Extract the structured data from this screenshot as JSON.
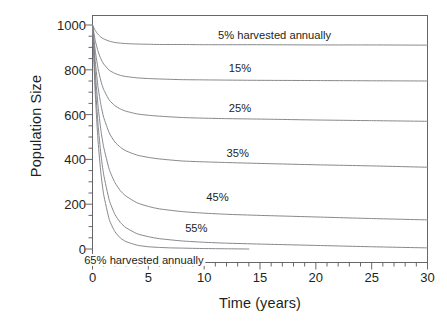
{
  "chart_data": {
    "type": "line",
    "title": "",
    "xlabel": "Time (years)",
    "ylabel": "Population Size",
    "xlim": [
      0,
      30
    ],
    "ylim": [
      0,
      1000
    ],
    "xticks": [
      0,
      5,
      10,
      15,
      20,
      25,
      30
    ],
    "yticks": [
      0,
      200,
      400,
      600,
      800,
      1000
    ],
    "xtick_labels": [
      "0",
      "5",
      "10",
      "15",
      "20",
      "25",
      "30"
    ],
    "ytick_labels": [
      "0",
      "200",
      "400",
      "600",
      "800",
      "1000"
    ],
    "xminor_step": 1,
    "yminor_step": 50,
    "grid": false,
    "legend": "inline-labels",
    "line_color": "#808286",
    "axis_color": "#58585b",
    "text_color": "#231f20",
    "background": "#ffffff",
    "initial_population": 1000,
    "series": [
      {
        "name": "5% harvested annually",
        "label": "5% harvested annually",
        "harvest_rate": 5,
        "label_x": 16.3,
        "label_y": 955,
        "equilibrium": 910,
        "x": [
          0,
          0.25,
          0.5,
          0.75,
          1,
          1.5,
          2,
          2.5,
          3,
          4,
          5,
          6,
          8,
          10,
          12,
          15,
          20,
          25,
          30
        ],
        "y": [
          1000,
          975,
          958,
          946,
          938,
          928,
          922,
          919,
          917,
          915,
          914,
          913,
          913,
          912,
          912,
          912,
          911,
          911,
          910
        ]
      },
      {
        "name": "15% harvested annually",
        "label": "15%",
        "harvest_rate": 15,
        "label_x": 13.2,
        "label_y": 810,
        "equilibrium": 750,
        "x": [
          0,
          0.25,
          0.5,
          0.75,
          1,
          1.5,
          2,
          2.5,
          3,
          4,
          5,
          6,
          8,
          10,
          12,
          15,
          20,
          25,
          30
        ],
        "y": [
          1000,
          930,
          882,
          849,
          826,
          798,
          784,
          775,
          770,
          764,
          761,
          759,
          756,
          755,
          754,
          753,
          752,
          751,
          750
        ]
      },
      {
        "name": "25% harvested annually",
        "label": "25%",
        "harvest_rate": 25,
        "label_x": 13.2,
        "label_y": 630,
        "equilibrium": 570,
        "x": [
          0,
          0.25,
          0.5,
          0.75,
          1,
          1.5,
          2,
          2.5,
          3,
          4,
          5,
          6,
          8,
          10,
          12,
          15,
          20,
          25,
          30
        ],
        "y": [
          1000,
          884,
          805,
          750,
          712,
          665,
          640,
          625,
          615,
          603,
          597,
          593,
          587,
          584,
          582,
          580,
          576,
          573,
          570
        ]
      },
      {
        "name": "35% harvested annually",
        "label": "35%",
        "harvest_rate": 35,
        "label_x": 13.0,
        "label_y": 430,
        "equilibrium": 365,
        "x": [
          0,
          0.25,
          0.5,
          0.75,
          1,
          1.5,
          2,
          2.5,
          3,
          4,
          5,
          6,
          8,
          10,
          12,
          15,
          20,
          25,
          30
        ],
        "y": [
          1000,
          835,
          722,
          644,
          588,
          518,
          478,
          454,
          438,
          419,
          409,
          402,
          393,
          389,
          386,
          382,
          376,
          371,
          365
        ]
      },
      {
        "name": "45% harvested annually",
        "label": "45%",
        "harvest_rate": 45,
        "label_x": 11.2,
        "label_y": 230,
        "equilibrium": 130,
        "x": [
          0,
          0.25,
          0.5,
          0.75,
          1,
          1.5,
          2,
          2.5,
          3,
          4,
          5,
          6,
          8,
          10,
          12,
          15,
          20,
          25,
          30
        ],
        "y": [
          1000,
          786,
          637,
          531,
          455,
          355,
          297,
          260,
          236,
          206,
          190,
          179,
          167,
          160,
          155,
          150,
          143,
          136,
          130
        ]
      },
      {
        "name": "55% harvested annually",
        "label": "55%",
        "harvest_rate": 55,
        "label_x": 9.3,
        "label_y": 95,
        "equilibrium": 5,
        "x": [
          0,
          0.25,
          0.5,
          0.75,
          1,
          1.5,
          2,
          2.5,
          3,
          4,
          5,
          6,
          8,
          10,
          12,
          15,
          20,
          25,
          30
        ],
        "y": [
          1000,
          736,
          553,
          424,
          332,
          218,
          155,
          118,
          95,
          68,
          55,
          46,
          36,
          30,
          26,
          22,
          16,
          10,
          5
        ]
      },
      {
        "name": "65% harvested annually",
        "label": "65% harvested annually",
        "harvest_rate": 65,
        "label_x": 4.6,
        "label_y": -48,
        "equilibrium": 0,
        "extinction_year": 14,
        "x": [
          0,
          0.25,
          0.5,
          0.75,
          1,
          1.5,
          2,
          2.5,
          3,
          4,
          5,
          6,
          7,
          8,
          10,
          12,
          14
        ],
        "y": [
          1000,
          688,
          480,
          339,
          243,
          132,
          78,
          49,
          33,
          17,
          10,
          7,
          5,
          4,
          2,
          1,
          0
        ]
      }
    ]
  }
}
